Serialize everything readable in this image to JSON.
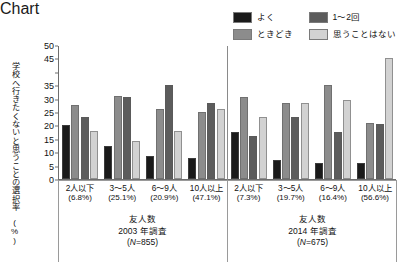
{
  "chart_data": {
    "type": "bar",
    "title": "",
    "xlabel": "友人数",
    "ylabel": "学校へ行きたくないと思うことの選択率",
    "ylabel_unit": "(%)",
    "ylim": [
      0,
      50
    ],
    "yticks": [
      "0",
      "5",
      "10",
      "15",
      "20",
      "25",
      "30",
      "35",
      "",
      "45",
      "50"
    ],
    "ytick_values": [
      0,
      5,
      10,
      15,
      20,
      25,
      30,
      35,
      40,
      45,
      50
    ],
    "grid": false,
    "legend_position": "top-right",
    "series": [
      {
        "name": "よく",
        "color": "#1a1a1a"
      },
      {
        "name": "ときどき",
        "color": "#8c8c8c"
      },
      {
        "name": "1〜2回",
        "color": "#5c5c5c"
      },
      {
        "name": "思うことはない",
        "color": "#d2d2d2"
      }
    ],
    "legend_order": [
      "よく",
      "1〜2回",
      "ときどき",
      "思うことはない"
    ],
    "panels": [
      {
        "caption_line1": "友人数",
        "caption_line2": "2003 年調査",
        "caption_line3": "(N=855)",
        "n_label": "N",
        "n_value": "=855",
        "categories": [
          {
            "label": "2人以下",
            "pct": "(6.8%)",
            "values": [
              20.0,
              27.5,
              23.0,
              18.0
            ]
          },
          {
            "label": "3〜5人",
            "pct": "(25.1%)",
            "values": [
              12.5,
              31.0,
              30.5,
              14.0
            ]
          },
          {
            "label": "6〜9人",
            "pct": "(20.9%)",
            "values": [
              8.5,
              26.0,
              35.0,
              18.0
            ]
          },
          {
            "label": "10人以上",
            "pct": "(47.1%)",
            "values": [
              8.0,
              25.0,
              28.5,
              26.0
            ]
          }
        ]
      },
      {
        "caption_line1": "友人数",
        "caption_line2": "2014 年調査",
        "caption_line3": "(N=675)",
        "n_label": "N",
        "n_value": "=675",
        "categories": [
          {
            "label": "2人以下",
            "pct": "(7.3%)",
            "values": [
              17.5,
              30.5,
              16.0,
              23.0
            ]
          },
          {
            "label": "3〜5人",
            "pct": "(19.7%)",
            "values": [
              7.0,
              28.5,
              23.0,
              28.5
            ]
          },
          {
            "label": "6〜9人",
            "pct": "(16.4%)",
            "values": [
              6.0,
              35.0,
              17.5,
              29.5
            ]
          },
          {
            "label": "10人以上",
            "pct": "(56.6%)",
            "values": [
              6.0,
              21.0,
              20.5,
              45.0
            ]
          }
        ]
      }
    ]
  }
}
